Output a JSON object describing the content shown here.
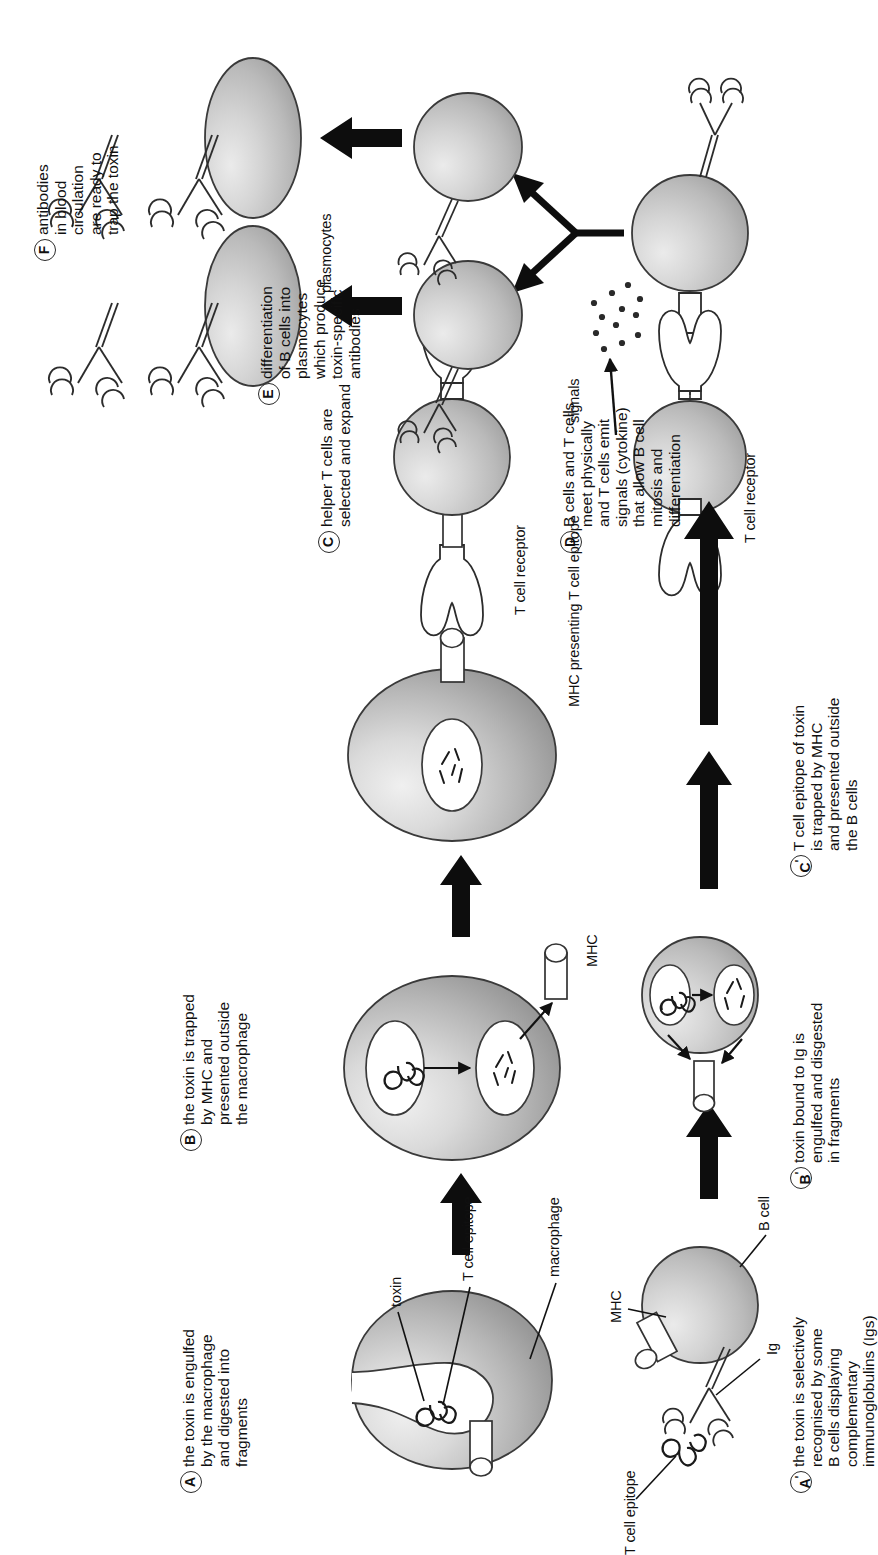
{
  "figure": {
    "accent_color": "#111111",
    "cell_fill": "#c9c9c9"
  },
  "steps_top": [
    {
      "id": "A",
      "prime": "",
      "text": "the toxin is engulfed\nby the macrophage\nand digested into\nfragments"
    },
    {
      "id": "B",
      "prime": "",
      "text": "the toxin is trapped\nby MHC and\npresented outside\nthe macrophage"
    },
    {
      "id": "C",
      "prime": "",
      "text": "helper T cells are\nselected and expand"
    },
    {
      "id": "D",
      "prime": "",
      "text": "B cells and T cells\nmeet physically\nand T cells emit\nsignals (cytokine)\nthat allow B cell\nmitosis and\ndifferentiation"
    },
    {
      "id": "E",
      "prime": "",
      "text": "differentiation\nof B cells into\nplasmocytes\nwhich produce\ntoxin-specific\nantibodies"
    },
    {
      "id": "F",
      "prime": "",
      "text": "antibodies\nin blood\ncirculation\nare ready to\ntrap the toxin"
    }
  ],
  "steps_bottom": [
    {
      "id": "A",
      "prime": "'",
      "text": "the toxin is selectively\nrecognised by some\nB cells displaying\ncomplementary\nimmunoglobulins (Igs)"
    },
    {
      "id": "B",
      "prime": "'",
      "text": "toxin bound to Ig is\nengulfed and disgested\nin fragments"
    },
    {
      "id": "C",
      "prime": "'",
      "text": "T cell epitope of toxin\nis trapped by MHC\nand presented outside\nthe B cells"
    }
  ],
  "annotations": {
    "toxin": "toxin",
    "t_cell_epitope": "T cell epitope",
    "macrophage": "macrophage",
    "mhc": "MHC",
    "mhc_presenting": "MHC presenting T cell epitope",
    "t_cell_receptor_top": "T cell receptor",
    "t_cell_receptor_bottom": "T cell receptor",
    "signals": "signals",
    "plasmocytes": "plasmocytes",
    "t_cell_epitope_b": "T cell epitope",
    "ig": "Ig",
    "mhc_b": "MHC",
    "b_cell": "B cell"
  }
}
